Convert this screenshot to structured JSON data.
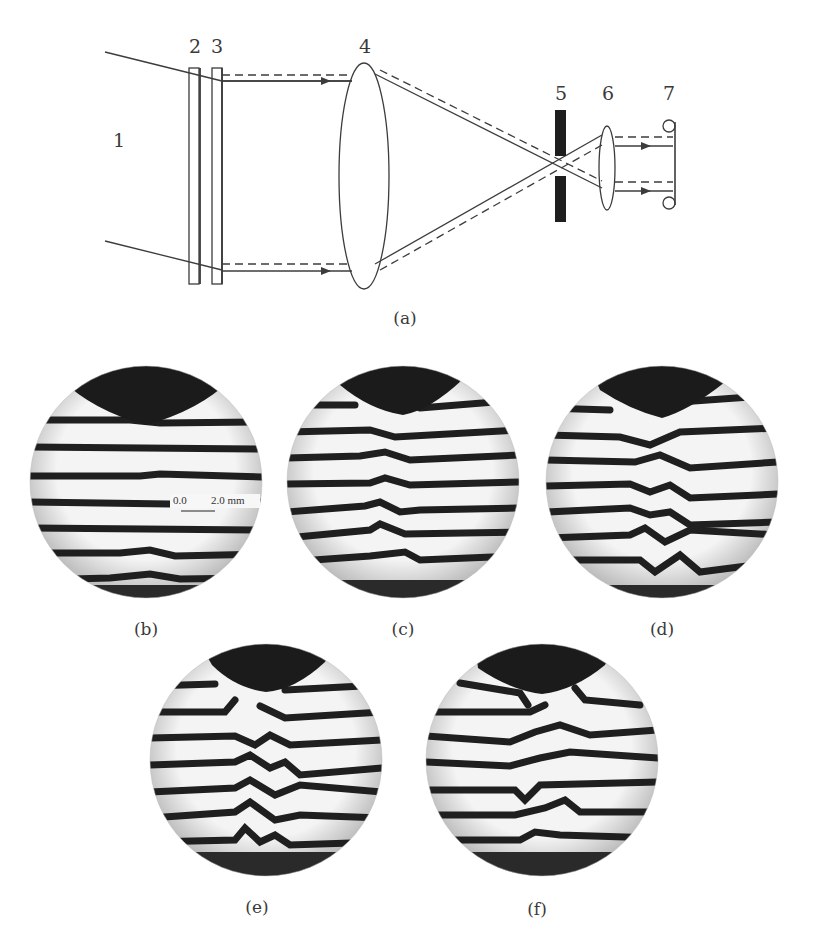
{
  "figure": {
    "schematic": {
      "caption": "(a)",
      "part_labels": [
        {
          "id": "1",
          "text": "1"
        },
        {
          "id": "2",
          "text": "2"
        },
        {
          "id": "3",
          "text": "3"
        },
        {
          "id": "4",
          "text": "4"
        },
        {
          "id": "5",
          "text": "5"
        },
        {
          "id": "6",
          "text": "6"
        },
        {
          "id": "7",
          "text": "7"
        }
      ]
    },
    "panels": [
      {
        "id": "b",
        "caption": "(b)"
      },
      {
        "id": "c",
        "caption": "(c)"
      },
      {
        "id": "d",
        "caption": "(d)"
      },
      {
        "id": "e",
        "caption": "(e)"
      },
      {
        "id": "f",
        "caption": "(f)"
      }
    ],
    "scale_bar": {
      "start": "0.0",
      "end": "2.0 mm"
    },
    "colors": {
      "line": "#3c3c3c",
      "fringe": "#1f1f1f",
      "background": "#ffffff",
      "field": "#f3f3f3"
    }
  }
}
